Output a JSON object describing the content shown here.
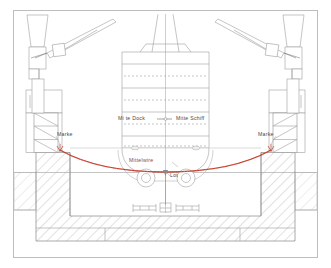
{
  "drawing": {
    "title": "Schiff im Dock - Querschnitt",
    "type": "technical-cross-section",
    "background": "#ffffff",
    "border_color": "#b9b9b9",
    "line_color": "#9a9a9a",
    "hatch_color": "#a8a8a8",
    "wire_color": "#c0392b",
    "text_color": "#4a4a4a"
  },
  "labels": {
    "mitte_dock": "Mi te Dock",
    "mitte_schiff": "Mitte Schiff",
    "marke_left": "Marke",
    "marke_right": "Marke",
    "mittelwire": "Mittelwire",
    "lot": "Lot"
  },
  "elements": {
    "crane_left": "crane-tower-left",
    "crane_right": "crane-tower-right",
    "ship_hull": "ship-hull-section",
    "dock_wall_left": "dock-wall-left",
    "dock_wall_right": "dock-wall-right",
    "dock_floor": "dock-floor",
    "keel_blocks": "keel-blocks",
    "ladder_left": "ladder-left",
    "ladder_right": "ladder-right",
    "wire_curve": "mittelwire-catenary",
    "plumb_line": "lot-plumb-line"
  }
}
